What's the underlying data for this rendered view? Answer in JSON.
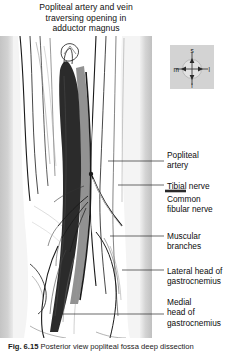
{
  "figure": {
    "title_lines": [
      "Popliteal artery and vein",
      "traversing opening in",
      "adductor magnus"
    ],
    "caption_prefix": "Fig. 6.15",
    "caption_text": "Posterior view  popliteal fossa  deep dissection",
    "illustration": {
      "name": "popliteal-fossa-dissection",
      "description": "Posterior view line drawing of the popliteal fossa with popliteal vessels, tibial and common fibular nerves and both heads of gastrocnemius",
      "vessel_fill": "#2b2b2b",
      "shadow_fill": "#8a8a8a",
      "outline_color": "#111111",
      "page_margin_color": "#c8c8c8"
    },
    "orientation": {
      "name": "orientation-compass",
      "superior": "s",
      "inferior": "i",
      "medial": "m",
      "lateral": "l",
      "background": "#d3d3d3"
    },
    "labels": [
      {
        "id": "popliteal-artery",
        "lines": [
          "Popliteal",
          "artery"
        ],
        "x": 167,
        "y": 150,
        "leader_y": 161,
        "leader_x1": 108,
        "leader_x2": 164,
        "pointer": false
      },
      {
        "id": "tibial-nerve",
        "lines": [
          "Tibial nerve"
        ],
        "x": 167,
        "y": 181,
        "leader_y": 185,
        "leader_x1": 118,
        "leader_x2": 164,
        "pointer": false
      },
      {
        "id": "common-fibular-nerve",
        "lines": [
          "Common",
          "fibular nerve"
        ],
        "x": 167,
        "y": 194,
        "leader_y": 191,
        "leader_x1": 165,
        "leader_x2": 186,
        "pointer": true
      },
      {
        "id": "muscular-branches",
        "lines": [
          "Muscular",
          "branches"
        ],
        "x": 167,
        "y": 231,
        "leader_y": 236,
        "leader_x1": 110,
        "leader_x2": 164,
        "pointer": false
      },
      {
        "id": "lateral-head-gastrocnemius",
        "lines": [
          "Lateral head of",
          "gastrocnemius"
        ],
        "x": 167,
        "y": 266,
        "leader_y": 270,
        "leader_x1": 122,
        "leader_x2": 164,
        "pointer": false
      },
      {
        "id": "medial-head-gastrocnemius",
        "lines": [
          "Medial",
          "head of",
          "gastrocnemius"
        ],
        "x": 167,
        "y": 297,
        "leader_y": 314,
        "leader_x1": 60,
        "leader_x2": 164,
        "pointer": false
      }
    ]
  }
}
